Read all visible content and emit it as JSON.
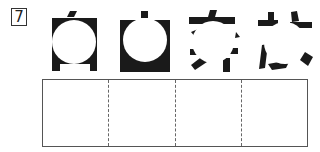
{
  "question": {
    "number": "7",
    "instruction": "",
    "glyph_count": 4,
    "glyphs": [
      {
        "id": 1,
        "name": "obscured-kanji-1",
        "hint": "masked character with box frame"
      },
      {
        "id": 2,
        "name": "obscured-kanji-2",
        "hint": "masked character with box frame and top dot"
      },
      {
        "id": 3,
        "name": "obscured-kanji-3",
        "hint": "masked character with top horizontal stroke"
      },
      {
        "id": 4,
        "name": "obscured-kanji-4",
        "hint": "masked character with cross strokes"
      }
    ]
  },
  "answer_area": {
    "cells": [
      "",
      "",
      "",
      ""
    ]
  },
  "colors": {
    "ink": "#1a1a1a",
    "background": "#ffffff",
    "border": "#555555"
  }
}
